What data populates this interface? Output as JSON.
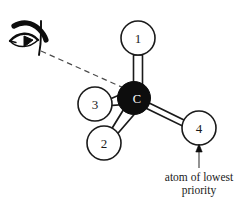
{
  "figure": {
    "background_color": "#ffffff",
    "stroke_color": "#1a1a1a",
    "center_fill_color": "#0d0d0d",
    "substituent_fill_color": "#ffffff"
  },
  "center_atom": {
    "label": "C",
    "name": "carbon-center"
  },
  "substituents": [
    {
      "label": "1",
      "name": "substituent-1",
      "position": "top",
      "bond_style": "hollow-line"
    },
    {
      "label": "2",
      "name": "substituent-2",
      "position": "lower-left",
      "bond_style": "hollow-wedge"
    },
    {
      "label": "3",
      "name": "substituent-3",
      "position": "left",
      "bond_style": "hollow-wedge"
    },
    {
      "label": "4",
      "name": "substituent-4",
      "position": "lower-right",
      "bond_style": "hollow-line"
    }
  ],
  "eye": {
    "name": "eye-icon",
    "alt": "eye viewing the stereocenter"
  },
  "sight_line": {
    "name": "line-of-sight",
    "style": "dashed"
  },
  "annotation": {
    "line_1": "atom of lowest",
    "line_2": "priority",
    "points_to": "4"
  }
}
